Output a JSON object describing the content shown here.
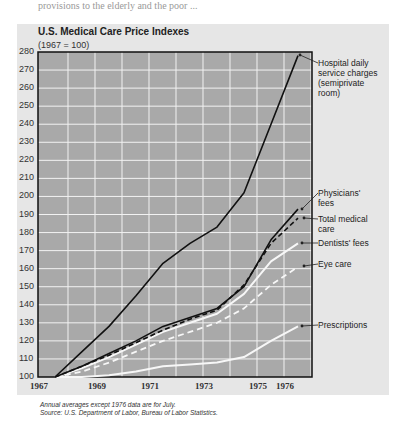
{
  "page_fragment": "provisions to the elderly and the poor ...",
  "chart_data": {
    "type": "line",
    "title": "U.S. Medical Care Price Indexes",
    "subtitle": "(1967 = 100)",
    "xlabel": "",
    "ylabel": "",
    "ylim": [
      100,
      280
    ],
    "yticks": [
      100,
      110,
      120,
      130,
      140,
      150,
      160,
      170,
      180,
      190,
      200,
      210,
      220,
      230,
      240,
      250,
      260,
      270,
      280
    ],
    "xtick_labels": [
      "1967",
      "1969",
      "1971",
      "1973",
      "1975",
      "1976"
    ],
    "x": [
      1967,
      1968,
      1969,
      1970,
      1971,
      1972,
      1973,
      1974,
      1975,
      1976
    ],
    "grid": true,
    "legend_position": "right, inline labels with arrows",
    "series": [
      {
        "name": "Hospital daily service charges (semiprivate room)",
        "style": "solid-black",
        "values": [
          100,
          114,
          128,
          145,
          163,
          174,
          183,
          202,
          240,
          278
        ]
      },
      {
        "name": "Physicians' fees",
        "style": "solid-black",
        "values": [
          100,
          106,
          113,
          120,
          128,
          133,
          138,
          150,
          176,
          193
        ]
      },
      {
        "name": "Total medical care",
        "style": "dashed-black",
        "values": [
          100,
          106,
          112,
          119,
          126,
          132,
          137,
          151,
          174,
          188
        ]
      },
      {
        "name": "Dentists' fees",
        "style": "solid-white",
        "values": [
          100,
          105,
          111,
          118,
          125,
          130,
          135,
          146,
          164,
          174
        ]
      },
      {
        "name": "Eye care",
        "style": "dashed-white",
        "values": [
          100,
          103,
          108,
          114,
          120,
          125,
          130,
          138,
          151,
          161
        ]
      },
      {
        "name": "Prescriptions",
        "style": "solid-white",
        "values": [
          100,
          100,
          101,
          103,
          106,
          107,
          108,
          111,
          120,
          128
        ]
      }
    ],
    "labels": {
      "hospital": [
        "Hospital daily",
        "service charges",
        "(semiprivate",
        "room)"
      ],
      "physicians": [
        "Physicians'",
        "fees"
      ],
      "total": [
        "Total medical",
        "care"
      ],
      "dentists": [
        "Dentists' fees"
      ],
      "eye": [
        "Eye care"
      ],
      "prescriptions": [
        "Prescriptions"
      ]
    },
    "notes": [
      "Annual averages except 1976 data are for July.",
      "Source: U.S. Department of Labor, Bureau of Labor Statistics."
    ]
  }
}
